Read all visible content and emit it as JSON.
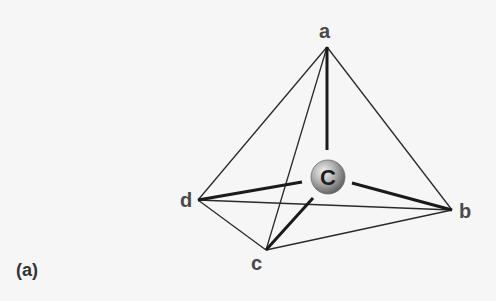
{
  "figure": {
    "panel_label": "(a)",
    "center_atom": {
      "label": "C",
      "x": 328,
      "y": 177,
      "r": 17
    },
    "vertices": {
      "a": {
        "label": "a",
        "x": 327,
        "y": 47,
        "label_x": 319,
        "label_y": 38
      },
      "b": {
        "label": "b",
        "x": 452,
        "y": 210,
        "label_x": 459,
        "label_y": 218
      },
      "c": {
        "label": "c",
        "x": 266,
        "y": 250,
        "label_x": 251,
        "label_y": 270
      },
      "d": {
        "label": "d",
        "x": 198,
        "y": 200,
        "label_x": 180,
        "label_y": 207
      }
    },
    "edges": [
      [
        "a",
        "b"
      ],
      [
        "a",
        "c"
      ],
      [
        "a",
        "d"
      ],
      [
        "b",
        "c"
      ],
      [
        "b",
        "d"
      ],
      [
        "c",
        "d"
      ]
    ],
    "bonds": [
      {
        "to": "a",
        "from_x": 327,
        "from_y": 150
      },
      {
        "to": "b",
        "from_x": 352,
        "from_y": 183
      },
      {
        "to": "c",
        "from_x": 313,
        "from_y": 198
      },
      {
        "to": "d",
        "from_x": 302,
        "from_y": 182
      }
    ],
    "colors": {
      "background": "#f6f6f6",
      "edge": "#2a2a2a",
      "bond": "#1a1a1a",
      "label": "#4a4a4a",
      "sphere_light": "#e4e4e4",
      "sphere_mid": "#a8a8a8",
      "sphere_dark": "#5e5e5e"
    }
  }
}
